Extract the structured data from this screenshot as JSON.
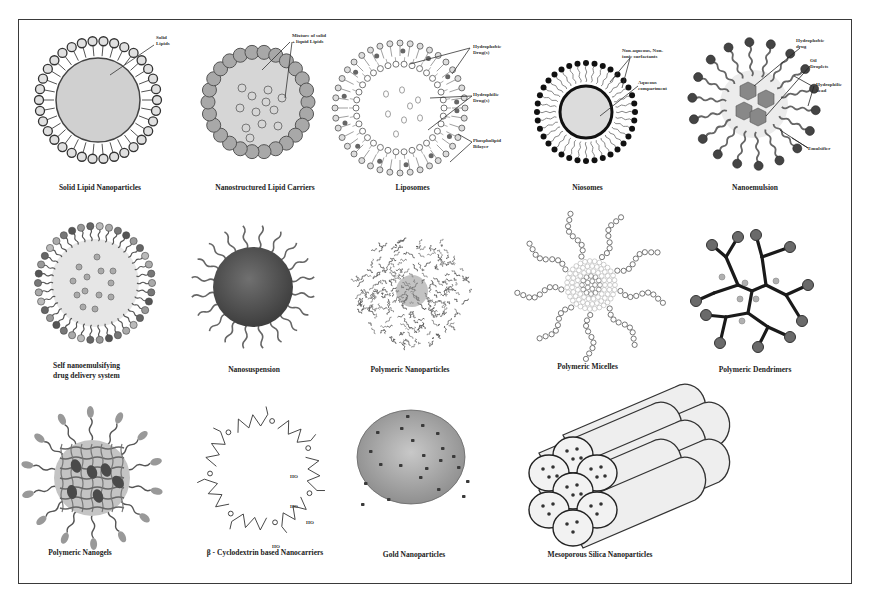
{
  "figure": {
    "colors": {
      "frame": "#3a3a3a",
      "ink": "#333333",
      "fill_light": "#d8d8d8",
      "fill_mid": "#9a9a9a",
      "fill_dark": "#5a5a5a"
    },
    "rows": [
      {
        "items": [
          {
            "caption": "Solid Lipid Nanoparticles",
            "labels": [
              "Solid",
              "Lipids"
            ]
          },
          {
            "caption": "Nanostructured Lipid Carriers",
            "labels": [
              "Mixture of solid",
              "+ liquid Lipids"
            ]
          },
          {
            "caption": "Liposomes",
            "labels": [
              "Hydrophobic",
              "Drug(s)",
              "Hydrophilic",
              "Drug(s)",
              "Phospholipid",
              "Bilayer"
            ]
          },
          {
            "caption": "Niosomes",
            "labels": [
              "Non-aqueous, Non-",
              "ionic surfactants",
              "Aqueous",
              "compartment"
            ]
          },
          {
            "caption": "Nanoemulsion",
            "labels": [
              "Hydrophobic",
              "drug",
              "Oil",
              "Droplets",
              "Hydrophilic",
              "head",
              "Emulsifier"
            ]
          }
        ]
      },
      {
        "items": [
          {
            "caption_line1": "Self nanoemulsifying",
            "caption_line2": "drug delivery system"
          },
          {
            "caption": "Nanosuspension"
          },
          {
            "caption": "Polymeric Nanoparticles"
          },
          {
            "caption": "Polymeric  Micelles"
          },
          {
            "caption": "Polymeric Dendrimers"
          }
        ]
      },
      {
        "items": [
          {
            "caption": "Polymeric Nanogels"
          },
          {
            "caption": "β - Cyclodextrin based Nanocarriers",
            "labels": [
              "HO",
              "HO",
              "HO",
              "HO"
            ]
          },
          {
            "caption": "Gold Nanoparticles"
          },
          {
            "caption": "Mesoporous Silica Nanoparticles"
          }
        ]
      }
    ]
  }
}
